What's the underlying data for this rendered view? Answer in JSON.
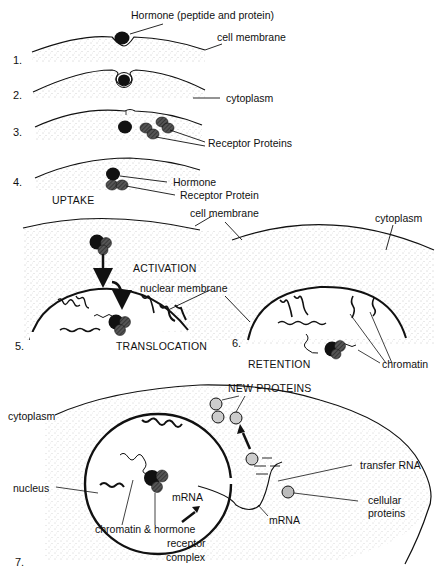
{
  "diagram": {
    "stages": [
      {
        "number": "1.",
        "labels": [
          "Hormone (peptide and protein)",
          "cell membrane"
        ]
      },
      {
        "number": "2.",
        "labels": [
          "cytoplasm"
        ]
      },
      {
        "number": "3.",
        "labels": [
          "Receptor Proteins"
        ]
      },
      {
        "number": "4.",
        "labels": [
          "Hormone",
          "Receptor Protein"
        ],
        "phase": "UPTAKE"
      },
      {
        "number": "5.",
        "labels": [
          "cell membrane",
          "nuclear membrane"
        ],
        "phases": [
          "ACTIVATION",
          "TRANSLOCATION"
        ]
      },
      {
        "number": "6.",
        "labels": [
          "cytoplasm",
          "chromatin"
        ],
        "phase": "RETENTION"
      },
      {
        "number": "7.",
        "labels": [
          "NEW PROTEINS",
          "cytoplasm",
          "nucleus",
          "chromatin & hormone receptor complex",
          "mRNA",
          "mRNA",
          "transfer RNA",
          "cellular proteins"
        ]
      }
    ]
  },
  "labels": {
    "s1_hormone": "Hormone (peptide and protein)",
    "s1_membrane": "cell membrane",
    "s1_num": "1.",
    "s2_cytoplasm": "cytoplasm",
    "s2_num": "2.",
    "s3_receptors": "Receptor Proteins",
    "s3_num": "3.",
    "s4_hormone": "Hormone",
    "s4_receptor": "Receptor Protein",
    "s4_uptake": "UPTAKE",
    "s4_num": "4.",
    "s5_membrane": "cell membrane",
    "s5_activation": "ACTIVATION",
    "s5_nuclear": "nuclear membrane",
    "s5_translocation": "TRANSLOCATION",
    "s5_num": "5.",
    "s6_cytoplasm": "cytoplasm",
    "s6_retention": "RETENTION",
    "s6_chromatin": "chromatin",
    "s6_num": "6.",
    "s7_new_proteins": "NEW PROTEINS",
    "s7_cytoplasm": "cytoplasm",
    "s7_nucleus": "nucleus",
    "s7_mrna_inner": "mRNA",
    "s7_chromatin_line1": "chromatin & hormone",
    "s7_chromatin_line2": "receptor",
    "s7_chromatin_line3": "complex",
    "s7_mrna_outer": "mRNA",
    "s7_trna": "transfer RNA",
    "s7_cellular_line1": "cellular",
    "s7_cellular_line2": "proteins",
    "s7_num": "7."
  }
}
